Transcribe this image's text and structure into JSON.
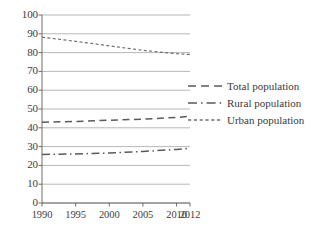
{
  "chart_data": {
    "type": "line",
    "title": "",
    "xlabel": "",
    "ylabel": "",
    "x": [
      1990,
      1995,
      2000,
      2005,
      2010,
      2012
    ],
    "categories": [
      "1990",
      "1995",
      "2000",
      "2005",
      "2010",
      "2012"
    ],
    "xlim": [
      1990,
      2012
    ],
    "ylim": [
      0,
      100
    ],
    "yticks": [
      0,
      10,
      20,
      30,
      40,
      50,
      60,
      70,
      80,
      90,
      100
    ],
    "ytick_labels": [
      "0",
      "10",
      "20",
      "30",
      "40",
      "50",
      "60",
      "70",
      "80",
      "90",
      "100"
    ],
    "grid": true,
    "grid_axis": "y",
    "legend_position": "right",
    "series": [
      {
        "name": "Total population",
        "style": "dashed",
        "color": "#5a5a5a",
        "values": [
          43,
          43.4,
          44,
          44.6,
          45.5,
          46.2
        ]
      },
      {
        "name": "Rural population",
        "style": "dash-dot",
        "color": "#5a5a5a",
        "values": [
          25.8,
          26.1,
          26.6,
          27.4,
          28.5,
          29.1
        ]
      },
      {
        "name": "Urban population",
        "style": "dotted",
        "color": "#6e6e6e",
        "values": [
          88.2,
          86,
          83.6,
          81.2,
          79.4,
          79
        ]
      }
    ]
  },
  "legend": {
    "items": [
      {
        "label": "Total population",
        "style": "dashed"
      },
      {
        "label": "Rural population",
        "style": "dash-dot"
      },
      {
        "label": "Urban population",
        "style": "dotted"
      }
    ]
  },
  "axis": {
    "y_labels": [
      "100",
      "90",
      "80",
      "70",
      "60",
      "50",
      "40",
      "30",
      "20",
      "10",
      "0"
    ],
    "x_labels": [
      "1990",
      "1995",
      "2000",
      "2005",
      "2010",
      "2012"
    ]
  },
  "colors": {
    "axis": "#6d6d6d",
    "grid": "#9a9a9a",
    "text": "#3a3a3a",
    "series_total": "#5a5a5a",
    "series_rural": "#5a5a5a",
    "series_urban": "#6e6e6e",
    "background": "#ffffff"
  }
}
